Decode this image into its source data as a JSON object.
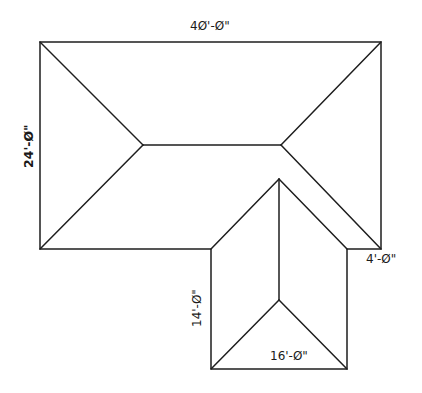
{
  "diagram": {
    "type": "roof plan",
    "dimensions": {
      "top_width": "4Ø'-Ø\"",
      "left_height": "24'-Ø\"",
      "right_offset": "4'-Ø\"",
      "wing_height": "14'-Ø\"",
      "wing_width": "16'-Ø\""
    },
    "colors": {
      "line": "#1e1e1e",
      "background": "#ffffff"
    }
  }
}
